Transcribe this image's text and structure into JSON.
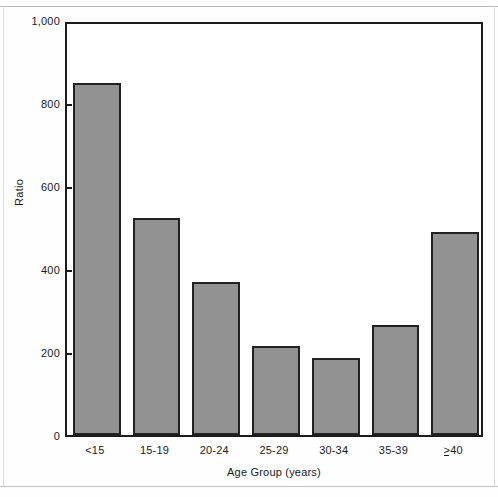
{
  "chart_data": {
    "type": "bar",
    "title": "",
    "xlabel": "Age Group (years)",
    "ylabel": "Ratio",
    "categories": [
      "<15",
      "15-19",
      "20-24",
      "25-29",
      "30-34",
      "35-39",
      "≥40"
    ],
    "values": [
      848,
      523,
      369,
      214,
      186,
      265,
      489
    ],
    "ylim": [
      0,
      1000
    ],
    "yticks": [
      0,
      200,
      400,
      600,
      800,
      1000
    ],
    "ytick_labels": [
      "0",
      "200",
      "400",
      "600",
      "800",
      "1,000"
    ],
    "grid": false,
    "legend": null,
    "bar_color": "#929292",
    "bar_edge_color": "#222222",
    "axis_color": "#1c1c1c",
    "background": "#ffffff"
  },
  "figure": {
    "y_axis_title": "Ratio",
    "x_axis_title": "Age Group (years)"
  }
}
